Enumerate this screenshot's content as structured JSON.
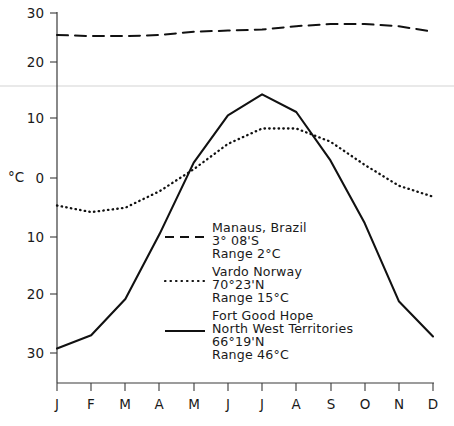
{
  "chart_data": {
    "type": "line",
    "title": "",
    "subtitle": "",
    "xlabel": "",
    "ylabel": "°C",
    "ylim": [
      -33,
      31
    ],
    "xlim": [
      "J",
      "D"
    ],
    "grid": false,
    "legend_position": "inside-center",
    "x": [
      "J",
      "F",
      "M",
      "A",
      "M",
      "J",
      "J",
      "A",
      "S",
      "O",
      "N",
      "D"
    ],
    "categories": [
      "J",
      "F",
      "M",
      "A",
      "M",
      "J",
      "J",
      "A",
      "S",
      "O",
      "N",
      "D"
    ],
    "ytick_labels": [
      "30",
      "20",
      "10",
      "0",
      "10",
      "20",
      "30"
    ],
    "ytick_values": [
      30,
      20,
      10,
      0,
      -10,
      -20,
      -30
    ],
    "series": [
      {
        "name": "Manaus, Brazil",
        "style": "dashed",
        "color": "#111111",
        "values": [
          26.0,
          25.8,
          25.8,
          26.0,
          26.6,
          26.8,
          27.0,
          27.6,
          28.0,
          28.0,
          27.6,
          26.6
        ]
      },
      {
        "name": "Vardo Norway",
        "style": "dotted",
        "color": "#111111",
        "values": [
          -5.0,
          -6.2,
          -5.4,
          -2.4,
          1.6,
          6.2,
          9.0,
          9.0,
          6.6,
          2.4,
          -1.4,
          -3.4
        ]
      },
      {
        "name": "Fort Good Hope",
        "style": "solid",
        "color": "#111111",
        "values": [
          -31.0,
          -28.6,
          -22.0,
          -10.2,
          2.8,
          11.4,
          15.2,
          12.0,
          3.2,
          -8.2,
          -22.4,
          -28.8
        ]
      }
    ]
  },
  "axis": {
    "unit_label": "°C",
    "y_ticks": [
      "30",
      "20",
      "10",
      "0",
      "10",
      "20",
      "30"
    ],
    "x_ticks": [
      "J",
      "F",
      "M",
      "A",
      "M",
      "J",
      "J",
      "A",
      "S",
      "O",
      "N",
      "D"
    ]
  },
  "legend": [
    {
      "style": "dashed",
      "line1": "Manaus, Brazil",
      "line2": "3° 08'S",
      "line3": "Range 2°C"
    },
    {
      "style": "dotted",
      "line1": "Vardo Norway",
      "line2": "70°23'N",
      "line3": "Range 15°C"
    },
    {
      "style": "solid",
      "line1": "Fort Good Hope",
      "line2": "North West Territories",
      "line3": "66°19'N",
      "line4": "Range 46°C"
    }
  ]
}
